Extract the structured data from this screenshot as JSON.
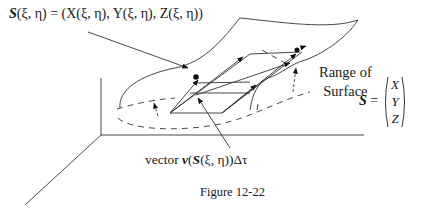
{
  "diagram": {
    "formula": {
      "lhs": "S",
      "args": "(ξ, η)",
      "rhs": " = (X(ξ, η), Y(ξ, η), Z(ξ, η))"
    },
    "range_label": {
      "line1": "Range  of",
      "line2": "Surface"
    },
    "s_vector": {
      "lhs": "S",
      "eq": " =",
      "components": [
        "X",
        "Y",
        "Z"
      ]
    },
    "vector_label": {
      "prefix": "vector  ",
      "v": "v",
      "open": "(",
      "s": "S",
      "args": "(ξ, η))Δτ"
    },
    "caption": "Figure 12-22"
  }
}
